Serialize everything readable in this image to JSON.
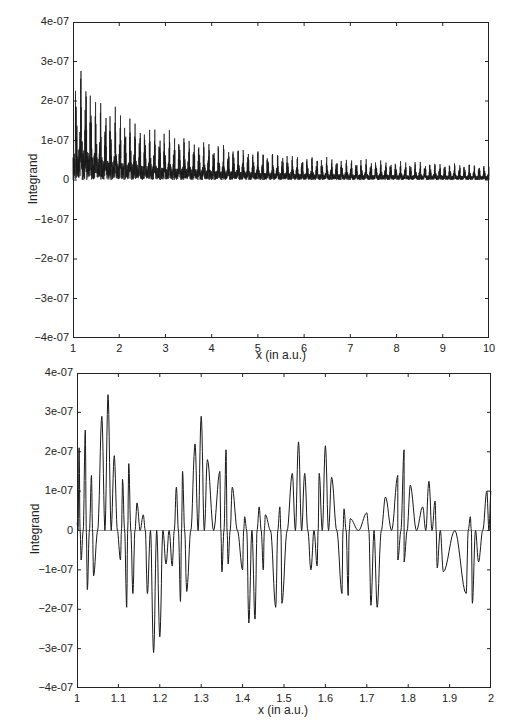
{
  "chart_data": [
    {
      "type": "line",
      "title": "",
      "xlabel": "x (in a.u.)",
      "ylabel": "Integrand",
      "xlim": [
        1,
        10
      ],
      "ylim": [
        -4e-07,
        4e-07
      ],
      "xticks": [
        1,
        2,
        3,
        4,
        5,
        6,
        7,
        8,
        9,
        10
      ],
      "xtick_labels": [
        "1",
        "2",
        "3",
        "4",
        "5",
        "6",
        "7",
        "8",
        "9",
        "10"
      ],
      "yticks": [
        4e-07,
        3e-07,
        2e-07,
        1e-07,
        0,
        -1e-07,
        -2e-07,
        -3e-07,
        -4e-07
      ],
      "ytick_labels": [
        "4e-07",
        "3e-07",
        "2e-07",
        "1e-07",
        "0",
        "-1e-07",
        "-2e-07",
        "-3e-07",
        "-4e-07"
      ],
      "grid": false,
      "legend": null,
      "series": [
        {
          "name": "Integrand",
          "description": "Rapidly oscillating, decaying integrand; dense burst structure (~9-10 bursts per unit x) with envelope decaying from ~3.4e-07 near x=1 to ~0.4e-07 near x=10",
          "envelope_max": {
            "x": [
              1.0,
              1.1,
              1.3,
              1.5,
              2.0,
              2.5,
              3.0,
              4.0,
              5.0,
              6.0,
              7.0,
              8.0,
              9.0,
              10.0
            ],
            "y": [
              2.6e-07,
              3.4e-07,
              2.85e-07,
              2.2e-07,
              1.8e-07,
              1.45e-07,
              1.3e-07,
              9.5e-08,
              8e-08,
              6.5e-08,
              5.5e-08,
              5e-08,
              4.5e-08,
              4e-08
            ]
          },
          "envelope_min": {
            "x": [
              1.0,
              1.2,
              1.4,
              1.7,
              2.0,
              2.5,
              3.0,
              4.0,
              5.0,
              6.0,
              7.0,
              8.0,
              9.0,
              10.0
            ],
            "y": [
              -1.5e-07,
              -3.15e-07,
              -2.4e-07,
              -1.9e-07,
              -1.85e-07,
              -1.45e-07,
              -1.25e-07,
              -1e-07,
              -7.5e-08,
              -6e-08,
              -5.5e-08,
              -5e-08,
              -4.5e-08,
              -4e-08
            ]
          }
        }
      ]
    },
    {
      "type": "line",
      "title": "",
      "xlabel": "x (in a.u.)",
      "ylabel": "Integrand",
      "xlim": [
        1,
        2
      ],
      "ylim": [
        -4e-07,
        4e-07
      ],
      "xticks": [
        1,
        1.1,
        1.2,
        1.3,
        1.4,
        1.5,
        1.6,
        1.7,
        1.8,
        1.9,
        2
      ],
      "xtick_labels": [
        "1",
        "1.1",
        "1.2",
        "1.3",
        "1.4",
        "1.5",
        "1.6",
        "1.7",
        "1.8",
        "1.9",
        "2"
      ],
      "yticks": [
        4e-07,
        3e-07,
        2e-07,
        1e-07,
        0,
        -1e-07,
        -2e-07,
        -3e-07,
        -4e-07
      ],
      "ytick_labels": [
        "4e-07",
        "3e-07",
        "2e-07",
        "1e-07",
        "0",
        "-1e-07",
        "-2e-07",
        "-3e-07",
        "-4e-07"
      ],
      "grid": false,
      "zero_line": true,
      "legend": null,
      "series": [
        {
          "name": "Integrand (zoom x=1..2)",
          "description": "Zoomed view of the same integrand showing beat-like wave packets; approx local extrema read from axes",
          "peaks": {
            "x": [
              1.005,
              1.02,
              1.035,
              1.06,
              1.075,
              1.09,
              1.11,
              1.125,
              1.145,
              1.16,
              1.24,
              1.255,
              1.285,
              1.3,
              1.315,
              1.345,
              1.36,
              1.375,
              1.405,
              1.44,
              1.455,
              1.49,
              1.52,
              1.535,
              1.55,
              1.585,
              1.6,
              1.615,
              1.645,
              1.66,
              1.7,
              1.745,
              1.775,
              1.79,
              1.805,
              1.835,
              1.85,
              1.865,
              1.95,
              1.99
            ],
            "y": [
              2.1e-07,
              2.55e-07,
              1.4e-07,
              2.9e-07,
              3.45e-07,
              1.9e-07,
              1.3e-07,
              1.7e-07,
              7e-08,
              4e-08,
              1.1e-07,
              1.5e-07,
              2.2e-07,
              2.9e-07,
              1.8e-07,
              1.5e-07,
              2.05e-07,
              1.1e-07,
              3.5e-08,
              6e-08,
              4e-08,
              6e-08,
              1.45e-07,
              2.25e-07,
              1.45e-07,
              1.45e-07,
              2.15e-07,
              1.35e-07,
              5.5e-08,
              3e-08,
              4.5e-08,
              8.5e-08,
              1.4e-07,
              2.05e-07,
              1.15e-07,
              6e-08,
              1.25e-07,
              7.5e-08,
              3.5e-08,
              1e-07
            ]
          },
          "troughs": {
            "x": [
              1.01,
              1.025,
              1.04,
              1.105,
              1.12,
              1.135,
              1.17,
              1.185,
              1.2,
              1.215,
              1.23,
              1.25,
              1.265,
              1.35,
              1.365,
              1.4,
              1.415,
              1.43,
              1.45,
              1.48,
              1.495,
              1.565,
              1.58,
              1.64,
              1.655,
              1.71,
              1.725,
              1.775,
              1.79,
              1.87,
              1.885,
              1.94,
              1.955,
              1.97
            ],
            "y": [
              -7.5e-08,
              -1.5e-07,
              -1.15e-07,
              -7.5e-08,
              -1.95e-07,
              -1.6e-07,
              -1.6e-07,
              -3.1e-07,
              -2.7e-07,
              -8.5e-08,
              -9e-08,
              -1.8e-07,
              -1.55e-07,
              -1.05e-07,
              -8.5e-08,
              -1e-07,
              -2.35e-07,
              -2.25e-07,
              -1e-07,
              -1.95e-07,
              -1.85e-07,
              -1e-07,
              -9e-08,
              -1.6e-07,
              -1.65e-07,
              -1.9e-07,
              -1.95e-07,
              -7.5e-08,
              -8e-08,
              -9.5e-08,
              -1.05e-07,
              -1.6e-07,
              -1.85e-07,
              -8e-08
            ]
          }
        }
      ]
    }
  ],
  "plots": {
    "top": {
      "ylabel": "Integrand",
      "xlabel": "x (in a.u.)",
      "yticks": [
        "4e-07",
        "3e-07",
        "2e-07",
        "1e-07",
        "0",
        "−1e-07",
        "−2e-07",
        "−3e-07",
        "−4e-07"
      ],
      "xticks": [
        "1",
        "2",
        "3",
        "4",
        "5",
        "6",
        "7",
        "8",
        "9",
        "10"
      ]
    },
    "bottom": {
      "ylabel": "Integrand",
      "xlabel": "x (in a.u.)",
      "yticks": [
        "4e-07",
        "3e-07",
        "2e-07",
        "1e-07",
        "0",
        "−1e-07",
        "−2e-07",
        "−3e-07",
        "−4e-07"
      ],
      "xticks": [
        "1",
        "1.1",
        "1.2",
        "1.3",
        "1.4",
        "1.5",
        "1.6",
        "1.7",
        "1.8",
        "1.9",
        "2"
      ]
    }
  },
  "style": {
    "line_color": "#1a1a1a",
    "frame_color": "#222222",
    "background": "#ffffff"
  }
}
